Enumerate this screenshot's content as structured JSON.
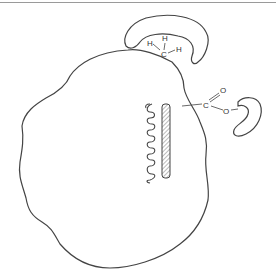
{
  "diagram": {
    "type": "protein-surface schematic",
    "colors": {
      "stroke": "#444444",
      "top_rule": "#9a9a9a",
      "background": "#ffffff"
    },
    "methyl_group": {
      "atoms": {
        "h1": "H",
        "h2": "H",
        "h3": "H",
        "c": "C"
      },
      "pocket": "hydrophobic pocket (top)"
    },
    "carboxylate_group": {
      "atoms": {
        "c": "C",
        "o_double": "O",
        "o_single": "O",
        "charge": "-"
      },
      "pocket": "binding pocket (right)"
    },
    "internal_features": {
      "helix": "alpha-helix coil",
      "strand": "hatched beta-strand"
    }
  }
}
